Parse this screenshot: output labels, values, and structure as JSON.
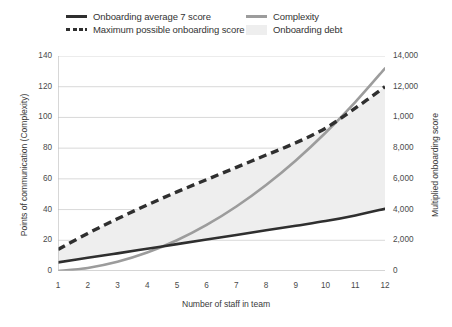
{
  "legend": {
    "items": [
      {
        "label": "Onboarding average 7 score",
        "marker": "solid-dark-line-swatch"
      },
      {
        "label": "Complexity",
        "marker": "solid-gray-line-swatch"
      },
      {
        "label": "Maximum possible onboarding score",
        "marker": "dashed-dark-line-swatch"
      },
      {
        "label": "Onboarding debt",
        "marker": "light-gray-area-swatch"
      }
    ]
  },
  "colors": {
    "onboarding_average": "#2f2f2f",
    "maximum_possible": "#2f2f2f",
    "complexity": "#9c9c9c",
    "onboarding_debt": "#eeeeee",
    "gridline": "#d9d9d9",
    "axis": "#bdbdbd"
  },
  "chart_data": {
    "type": "line",
    "title": "",
    "xlabel": "Number of staff in team",
    "ylabel": "Points of communication (Complexity)",
    "y2label": "Multiplied onboarding score",
    "x": [
      1,
      2,
      3,
      4,
      5,
      6,
      7,
      8,
      9,
      10,
      11,
      12
    ],
    "xticklabels": [
      "1",
      "2",
      "3",
      "4",
      "5",
      "6",
      "7",
      "8",
      "9",
      "10",
      "11",
      "12"
    ],
    "ylim": [
      0,
      140
    ],
    "yticks": [
      0,
      20,
      40,
      60,
      80,
      100,
      120,
      140
    ],
    "yticklabels": [
      "0",
      "20",
      "40",
      "60",
      "80",
      "100",
      "120",
      "140"
    ],
    "y2lim": [
      0,
      14000
    ],
    "y2ticks": [
      0,
      2000,
      4000,
      6000,
      8000,
      10000,
      12000,
      14000
    ],
    "y2ticklabels": [
      "0",
      "2,000",
      "4,000",
      "6,000",
      "8,000",
      "1,000",
      "12,000",
      "14,000"
    ],
    "grid": true,
    "legend_position": "top",
    "series": [
      {
        "name": "Complexity",
        "axis": "left",
        "style": "solid",
        "color": "#9c9c9c",
        "values": [
          0,
          2,
          6,
          12,
          20,
          30,
          42,
          56,
          72,
          90,
          110,
          132
        ]
      },
      {
        "name": "Maximum possible onboarding score",
        "axis": "right",
        "style": "dashed",
        "color": "#2f2f2f",
        "values": [
          1400,
          2450,
          3400,
          4300,
          5150,
          5950,
          6750,
          7550,
          8350,
          9300,
          10600,
          12000
        ]
      },
      {
        "name": "Onboarding average 7 score",
        "axis": "right",
        "style": "solid",
        "color": "#2f2f2f",
        "values": [
          560,
          860,
          1150,
          1450,
          1750,
          2050,
          2350,
          2650,
          2950,
          3250,
          3620,
          4050
        ]
      }
    ],
    "areas": [
      {
        "name": "Onboarding debt",
        "color": "#eeeeee",
        "between": [
          "Maximum possible onboarding score",
          "Onboarding average 7 score"
        ]
      }
    ]
  }
}
